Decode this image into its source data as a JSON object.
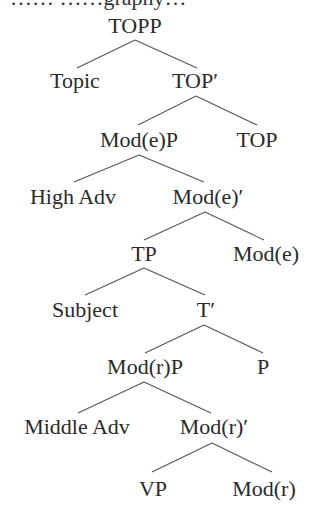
{
  "caption_partial": "…… ……graphy…",
  "colors": {
    "text": "#2a2a2a",
    "edge": "#555555",
    "background": "#ffffff"
  },
  "tree": {
    "nodes": [
      {
        "id": "topp",
        "label": "TOPP",
        "x": 135,
        "y": 33
      },
      {
        "id": "topic",
        "label": "Topic",
        "x": 75,
        "y": 88
      },
      {
        "id": "top_bar",
        "label": "TOP′",
        "x": 195,
        "y": 88
      },
      {
        "id": "modep",
        "label": "Mod(e)P",
        "x": 139,
        "y": 147
      },
      {
        "id": "top",
        "label": "TOP",
        "x": 257,
        "y": 147
      },
      {
        "id": "high_adv",
        "label": "High Adv",
        "x": 73,
        "y": 204
      },
      {
        "id": "mode_bar",
        "label": "Mod(e)′",
        "x": 208,
        "y": 204
      },
      {
        "id": "tp",
        "label": "TP",
        "x": 144,
        "y": 261
      },
      {
        "id": "mode",
        "label": "Mod(e)",
        "x": 266,
        "y": 261
      },
      {
        "id": "subject",
        "label": "Subject",
        "x": 85,
        "y": 317
      },
      {
        "id": "t_bar",
        "label": "T′",
        "x": 206,
        "y": 317
      },
      {
        "id": "modrp",
        "label": "Mod(r)P",
        "x": 145,
        "y": 374
      },
      {
        "id": "p",
        "label": "P",
        "x": 263,
        "y": 374
      },
      {
        "id": "middle_adv",
        "label": "Middle Adv",
        "x": 77,
        "y": 434
      },
      {
        "id": "modr_bar",
        "label": "Mod(r)′",
        "x": 214,
        "y": 434
      },
      {
        "id": "vp",
        "label": "VP",
        "x": 153,
        "y": 496
      },
      {
        "id": "modr",
        "label": "Mod(r)",
        "x": 264,
        "y": 496
      }
    ],
    "edges": [
      {
        "from": "topp",
        "to": "topic",
        "x1": 135,
        "y1": 40,
        "x2": 77,
        "y2": 68
      },
      {
        "from": "topp",
        "to": "top_bar",
        "x1": 135,
        "y1": 40,
        "x2": 197,
        "y2": 68
      },
      {
        "from": "top_bar",
        "to": "modep",
        "x1": 196,
        "y1": 96,
        "x2": 138,
        "y2": 125
      },
      {
        "from": "top_bar",
        "to": "top",
        "x1": 196,
        "y1": 96,
        "x2": 257,
        "y2": 125
      },
      {
        "from": "modep",
        "to": "high_adv",
        "x1": 139,
        "y1": 155,
        "x2": 74,
        "y2": 182
      },
      {
        "from": "modep",
        "to": "mode_bar",
        "x1": 139,
        "y1": 155,
        "x2": 204,
        "y2": 182
      },
      {
        "from": "mode_bar",
        "to": "tp",
        "x1": 205,
        "y1": 212,
        "x2": 144,
        "y2": 240
      },
      {
        "from": "mode_bar",
        "to": "mode",
        "x1": 205,
        "y1": 212,
        "x2": 264,
        "y2": 240
      },
      {
        "from": "tp",
        "to": "subject",
        "x1": 144,
        "y1": 268,
        "x2": 85,
        "y2": 295
      },
      {
        "from": "tp",
        "to": "t_bar",
        "x1": 144,
        "y1": 268,
        "x2": 205,
        "y2": 295
      },
      {
        "from": "t_bar",
        "to": "modrp",
        "x1": 204,
        "y1": 325,
        "x2": 145,
        "y2": 353
      },
      {
        "from": "t_bar",
        "to": "p",
        "x1": 204,
        "y1": 325,
        "x2": 263,
        "y2": 353
      },
      {
        "from": "modrp",
        "to": "middle_adv",
        "x1": 144,
        "y1": 382,
        "x2": 78,
        "y2": 413
      },
      {
        "from": "modrp",
        "to": "modr_bar",
        "x1": 144,
        "y1": 382,
        "x2": 211,
        "y2": 413
      },
      {
        "from": "modr_bar",
        "to": "vp",
        "x1": 212,
        "y1": 443,
        "x2": 152,
        "y2": 472
      },
      {
        "from": "modr_bar",
        "to": "modr",
        "x1": 212,
        "y1": 443,
        "x2": 272,
        "y2": 472
      }
    ]
  }
}
